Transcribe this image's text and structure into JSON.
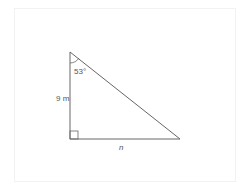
{
  "diagram": {
    "type": "right-triangle",
    "angle_label": "53°",
    "vertical_side_label": "9 m",
    "horizontal_side_label": "n",
    "stroke_color": "#555555",
    "vertices": {
      "top": [
        70,
        52
      ],
      "right_angle": [
        70,
        139
      ],
      "right": [
        180,
        139
      ]
    }
  }
}
